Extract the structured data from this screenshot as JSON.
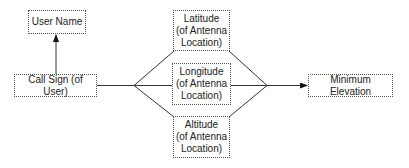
{
  "diagram": {
    "type": "flow",
    "colors": {
      "line": "#333333",
      "border": "#555555",
      "text": "#222222",
      "background": "#ffffff"
    },
    "nodes": {
      "user_name": {
        "label": "User Name"
      },
      "call_sign": {
        "label": "Call Sign (of User)"
      },
      "latitude": {
        "label": "Latitude\n(of Antenna\nLocation)"
      },
      "longitude": {
        "label": "Longitude\n(of Antenna\nLocation)"
      },
      "altitude": {
        "label": "Altitude\n(of Antenna\nLocation)"
      },
      "minimum_elevation": {
        "label": "Minimum Elevation"
      }
    },
    "edges": [
      {
        "from": "Call Sign (of User)",
        "to": "User Name",
        "arrow": true
      },
      {
        "from": "Call Sign (of User)",
        "to": "Latitude (of Antenna Location)",
        "arrow": false
      },
      {
        "from": "Call Sign (of User)",
        "to": "Longitude (of Antenna Location)",
        "arrow": false
      },
      {
        "from": "Call Sign (of User)",
        "to": "Altitude (of Antenna Location)",
        "arrow": false
      },
      {
        "from": "Latitude (of Antenna Location)",
        "to": "Minimum Elevation",
        "arrow": true
      },
      {
        "from": "Longitude (of Antenna Location)",
        "to": "Minimum Elevation",
        "arrow": true
      },
      {
        "from": "Altitude (of Antenna Location)",
        "to": "Minimum Elevation",
        "arrow": true
      }
    ]
  }
}
